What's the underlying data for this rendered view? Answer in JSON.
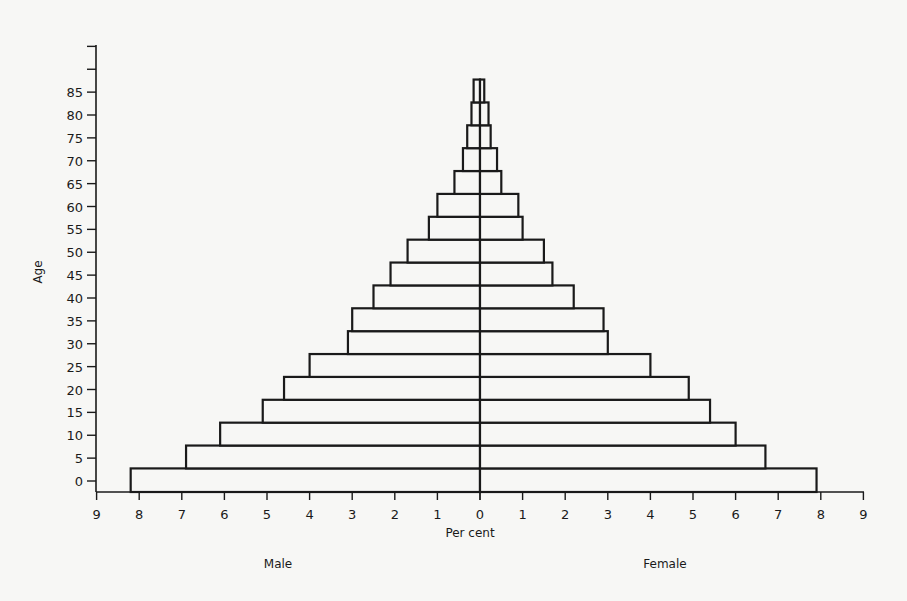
{
  "chart_data": {
    "type": "bar",
    "subtype": "population-pyramid",
    "title": "",
    "xlabel": "Per cent",
    "ylabel": "Age",
    "xlim": [
      -9,
      9
    ],
    "x_ticks_left": [
      "9",
      "8",
      "7",
      "6",
      "5",
      "4",
      "3",
      "2",
      "1",
      "0"
    ],
    "x_ticks_right": [
      "1",
      "2",
      "3",
      "4",
      "5",
      "6",
      "7",
      "8",
      "9"
    ],
    "y_ticks": [
      "0",
      "5",
      "10",
      "15",
      "20",
      "25",
      "30",
      "35",
      "40",
      "45",
      "50",
      "55",
      "60",
      "65",
      "70",
      "75",
      "80",
      "85"
    ],
    "grid": false,
    "categories": [
      "0-4",
      "5-9",
      "10-14",
      "15-19",
      "20-24",
      "25-29",
      "30-34",
      "35-39",
      "40-44",
      "45-49",
      "50-54",
      "55-59",
      "60-64",
      "65-69",
      "70-74",
      "75-79",
      "80-84",
      "85+"
    ],
    "series": [
      {
        "name": "Male",
        "side": "left",
        "values": [
          8.2,
          6.9,
          6.1,
          5.1,
          4.6,
          4.0,
          3.1,
          3.0,
          2.5,
          2.1,
          1.7,
          1.2,
          1.0,
          0.6,
          0.4,
          0.3,
          0.2,
          0.15
        ]
      },
      {
        "name": "Female",
        "side": "right",
        "values": [
          7.9,
          6.7,
          6.0,
          5.4,
          4.9,
          4.0,
          3.0,
          2.9,
          2.2,
          1.7,
          1.5,
          1.0,
          0.9,
          0.5,
          0.4,
          0.25,
          0.2,
          0.1
        ]
      }
    ],
    "legend": {
      "left_label": "Male",
      "right_label": "Female",
      "position": "bottom"
    }
  },
  "labels": {
    "y_axis": "Age",
    "x_axis": "Per cent",
    "male": "Male",
    "female": "Female"
  }
}
